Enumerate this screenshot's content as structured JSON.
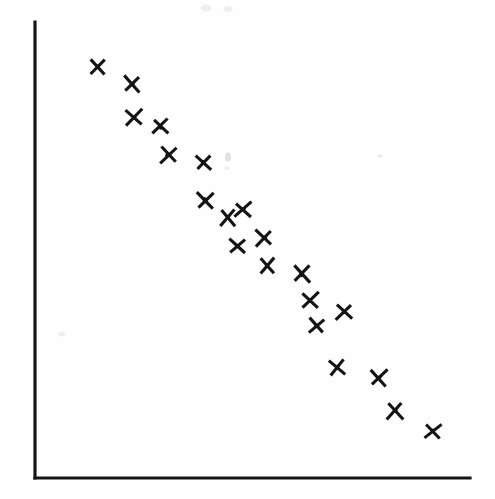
{
  "figure": {
    "width": 495,
    "height": 499,
    "background_color": "#fefefe",
    "ink_color": "#141414"
  },
  "axes": {
    "y_axis": {
      "x": 35,
      "y_top": 22,
      "y_bottom": 478,
      "color": "#161616",
      "label": ""
    },
    "x_axis": {
      "y": 478,
      "x_left": 35,
      "x_right": 470,
      "color": "#161616",
      "label": ""
    },
    "tick_labels_visible": false,
    "grid": false,
    "frame": "left-and-bottom-only"
  },
  "marker": {
    "shape": "x-cross",
    "size_px": 15,
    "stroke_width_px": 3.1,
    "color": "#141414"
  },
  "artifacts": [
    {
      "name": "scan-smudge-mid",
      "x": 228,
      "y": 157,
      "rx": 3.0,
      "ry": 4.5,
      "tone": "light-gray"
    },
    {
      "name": "scan-smudge-mid-low",
      "x": 227,
      "y": 168,
      "rx": 2.2,
      "ry": 2.2,
      "tone": "very-light-gray"
    },
    {
      "name": "scan-smudge-top-left",
      "x": 206,
      "y": 8,
      "rx": 5.5,
      "ry": 3.5,
      "tone": "very-light-gray"
    },
    {
      "name": "scan-smudge-top-right",
      "x": 228,
      "y": 9,
      "rx": 4.5,
      "ry": 3.0,
      "tone": "very-light-gray"
    },
    {
      "name": "scan-smudge-right",
      "x": 380,
      "y": 156,
      "rx": 3.0,
      "ry": 2.0,
      "tone": "very-light-gray"
    },
    {
      "name": "scan-smudge-low-left",
      "x": 62,
      "y": 334,
      "rx": 3.5,
      "ry": 2.5,
      "tone": "very-light-gray"
    }
  ],
  "chart_data": {
    "type": "scatter",
    "title": "",
    "subtitle": "",
    "xlabel": "",
    "ylabel": "",
    "xlim": [
      35,
      470
    ],
    "ylim": [
      478,
      22
    ],
    "grid": false,
    "legend": null,
    "legend_position": "none",
    "series": [
      {
        "name": "observations",
        "marker": "x",
        "color": "#141414",
        "n_points": 24,
        "points": [
          {
            "x": 97,
            "y": 66
          },
          {
            "x": 132,
            "y": 84
          },
          {
            "x": 134,
            "y": 117
          },
          {
            "x": 161,
            "y": 127
          },
          {
            "x": 168,
            "y": 155
          },
          {
            "x": 204,
            "y": 162
          },
          {
            "x": 205,
            "y": 200
          },
          {
            "x": 228,
            "y": 218
          },
          {
            "x": 243,
            "y": 210
          },
          {
            "x": 264,
            "y": 238
          },
          {
            "x": 237,
            "y": 246
          },
          {
            "x": 267,
            "y": 265
          },
          {
            "x": 302,
            "y": 274
          },
          {
            "x": 311,
            "y": 300
          },
          {
            "x": 344,
            "y": 312
          },
          {
            "x": 316,
            "y": 326
          },
          {
            "x": 337,
            "y": 367
          },
          {
            "x": 379,
            "y": 378
          },
          {
            "x": 395,
            "y": 411
          },
          {
            "x": 433,
            "y": 431
          },
          {
            "x": 150,
            "y": 128
          },
          {
            "x": 205,
            "y": 200
          },
          {
            "x": 229,
            "y": 219
          },
          {
            "x": 302,
            "y": 275
          }
        ],
        "unique_points": [
          {
            "x": 97,
            "y": 66
          },
          {
            "x": 132,
            "y": 84
          },
          {
            "x": 134,
            "y": 117
          },
          {
            "x": 161,
            "y": 127
          },
          {
            "x": 168,
            "y": 155
          },
          {
            "x": 204,
            "y": 162
          },
          {
            "x": 205,
            "y": 200
          },
          {
            "x": 228,
            "y": 218
          },
          {
            "x": 243,
            "y": 210
          },
          {
            "x": 264,
            "y": 238
          },
          {
            "x": 237,
            "y": 246
          },
          {
            "x": 267,
            "y": 265
          },
          {
            "x": 302,
            "y": 274
          },
          {
            "x": 311,
            "y": 300
          },
          {
            "x": 344,
            "y": 312
          },
          {
            "x": 316,
            "y": 326
          },
          {
            "x": 337,
            "y": 367
          },
          {
            "x": 379,
            "y": 378
          },
          {
            "x": 395,
            "y": 411
          },
          {
            "x": 433,
            "y": 431
          }
        ],
        "trend": "negative"
      }
    ]
  }
}
